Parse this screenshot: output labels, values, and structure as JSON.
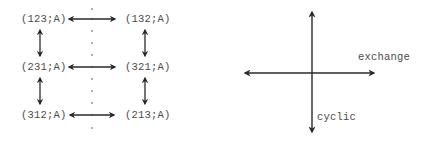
{
  "left_diagram": {
    "nodes": [
      {
        "id": "n1",
        "label": "(123;A)",
        "row": 0,
        "col": 0
      },
      {
        "id": "n2",
        "label": "(132;A)",
        "row": 0,
        "col": 1
      },
      {
        "id": "n3",
        "label": "(231;A)",
        "row": 1,
        "col": 0
      },
      {
        "id": "n4",
        "label": "(321;A)",
        "row": 1,
        "col": 1
      },
      {
        "id": "n5",
        "label": "(312;A)",
        "row": 2,
        "col": 0
      },
      {
        "id": "n6",
        "label": "(213;A)",
        "row": 2,
        "col": 1
      }
    ],
    "edges": [
      {
        "from": "n1",
        "to": "n2",
        "type": "double-arrow-horizontal"
      },
      {
        "from": "n3",
        "to": "n4",
        "type": "double-arrow-horizontal"
      },
      {
        "from": "n5",
        "to": "n6",
        "type": "double-arrow-horizontal"
      },
      {
        "from": "n1",
        "to": "n3",
        "type": "double-arrow-vertical"
      },
      {
        "from": "n3",
        "to": "n5",
        "type": "double-arrow-vertical"
      },
      {
        "from": "n2",
        "to": "n4",
        "type": "double-arrow-vertical"
      },
      {
        "from": "n4",
        "to": "n6",
        "type": "double-arrow-vertical"
      }
    ],
    "mirror_line": "dotted-vertical"
  },
  "right_diagram": {
    "axes": {
      "horizontal_label": "exchange",
      "vertical_label": "cyclic"
    }
  },
  "colors": {
    "ink": "#2a2a2a",
    "text": "#4a4a4a",
    "background": "#ffffff"
  }
}
